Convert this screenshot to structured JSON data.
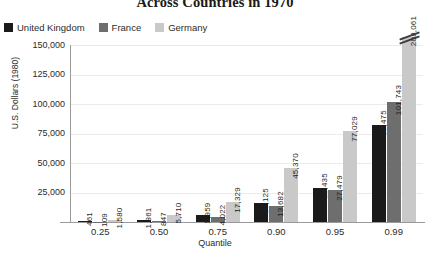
{
  "chart_data": {
    "type": "bar",
    "title": "Across Countries in 1970",
    "xlabel": "Quantile",
    "ylabel": "U.S. Dollars (1980)",
    "categories": [
      "0.25",
      "0.50",
      "0.75",
      "0.90",
      "0.95",
      "0.99"
    ],
    "series": [
      {
        "name": "United Kingdom",
        "color": "#1a1a1a",
        "values": [
          461,
          1861,
          5959,
          16125,
          28435,
          82475
        ],
        "labels": [
          "461",
          "1,861",
          "5,959",
          "16,125",
          "28,435",
          "82,475"
        ]
      },
      {
        "name": "France",
        "color": "#6e6e6e",
        "values": [
          109,
          847,
          4022,
          13682,
          27479,
          101743
        ],
        "labels": [
          "109",
          "847",
          "4,022",
          "13,682",
          "27,479",
          "101,743"
        ]
      },
      {
        "name": "Germany",
        "color": "#c9c9c9",
        "values": [
          1580,
          5710,
          17329,
          45370,
          77029,
          208061
        ],
        "labels": [
          "1,580",
          "5,710",
          "17,329",
          "45,370",
          "77,029",
          "208,061"
        ]
      }
    ],
    "ylim": [
      0,
      150000
    ],
    "yticks": [
      "150,000",
      "125,000",
      "100,000",
      "75,000",
      "50,000",
      "25,000"
    ],
    "ytick_values": [
      150000,
      125000,
      100000,
      75000,
      50000,
      25000
    ],
    "grid": true,
    "legend_position": "top-left",
    "truncated_bars": [
      {
        "series": "Germany",
        "category": "0.99",
        "value": 208061,
        "note": "bar broken with axis-break mark above plot top"
      }
    ]
  },
  "legend": {
    "items": [
      {
        "label": "United Kingdom",
        "color": "#1a1a1a"
      },
      {
        "label": "France",
        "color": "#6e6e6e"
      },
      {
        "label": "Germany",
        "color": "#c9c9c9"
      }
    ]
  }
}
